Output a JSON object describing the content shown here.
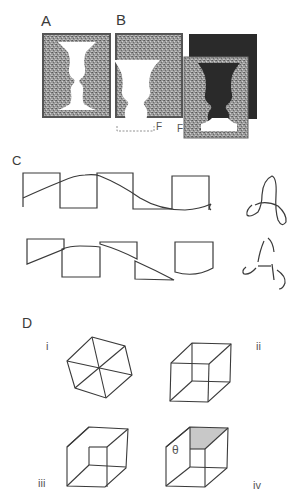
{
  "figure": {
    "panels": {
      "A": {
        "label": "A"
      },
      "B": {
        "label": "B",
        "marks": [
          "F",
          "F"
        ]
      },
      "C": {
        "label": "C"
      },
      "D": {
        "label": "D",
        "sublabels": [
          "i",
          "ii",
          "iii",
          "iv"
        ],
        "angle_symbol": "θ"
      }
    }
  },
  "colors": {
    "ink": "#3a3a3a",
    "texture_mid": "#8a8a8a",
    "texture_dark": "#5a5a5a",
    "dark_square": "#2a2a2a",
    "shade": "#c8c8c8"
  }
}
